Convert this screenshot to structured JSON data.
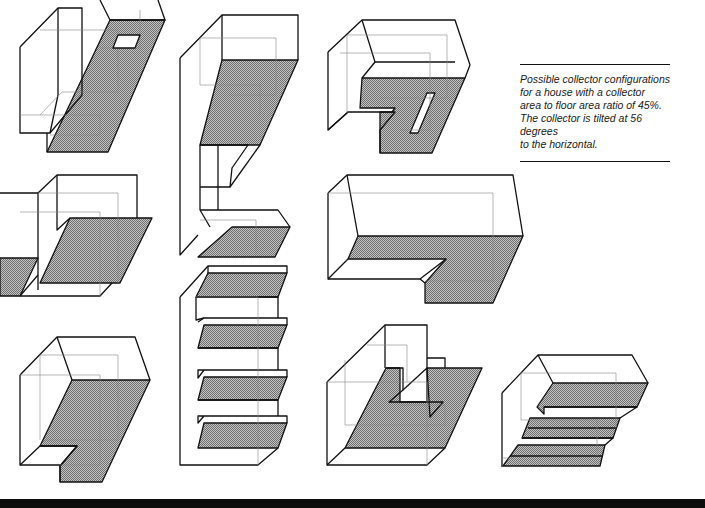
{
  "caption": {
    "text": "Possible collector configurations for a house with a collector area to floor area ratio of 45%. The collector is tilted at 56 degrees to the horizontal.",
    "lines": [
      "Possible collector configurations",
      "for a house with a collector",
      "area to floor area ratio of 45%.",
      "The collector is tilted at 56 degrees",
      "to the horizontal."
    ],
    "collector_area_ratio": "45%",
    "tilt_degrees": 56
  },
  "figures": [
    {
      "id": "config-1",
      "description": "tall block with sloped collector and skylight"
    },
    {
      "id": "config-2",
      "description": "C-shaped tall block with two collector planes"
    },
    {
      "id": "config-3",
      "description": "block with notched collector and slot"
    },
    {
      "id": "config-4",
      "description": "two offset blocks with collector planes"
    },
    {
      "id": "config-5",
      "description": "wide block with L-shaped collector"
    },
    {
      "id": "config-6",
      "description": "stepped block with four collector strips"
    },
    {
      "id": "config-7",
      "description": "block with notched sloped collector"
    },
    {
      "id": "config-8",
      "description": "block with courtyard notch and large collector"
    },
    {
      "id": "config-9",
      "description": "block with three stepped collector bands"
    }
  ],
  "colors": {
    "line": "#111111",
    "hidden_line": "#888888",
    "collector_fill": "#9a9a9a",
    "background": "#ffffff",
    "bottom_bar": "#0d0d0d"
  }
}
